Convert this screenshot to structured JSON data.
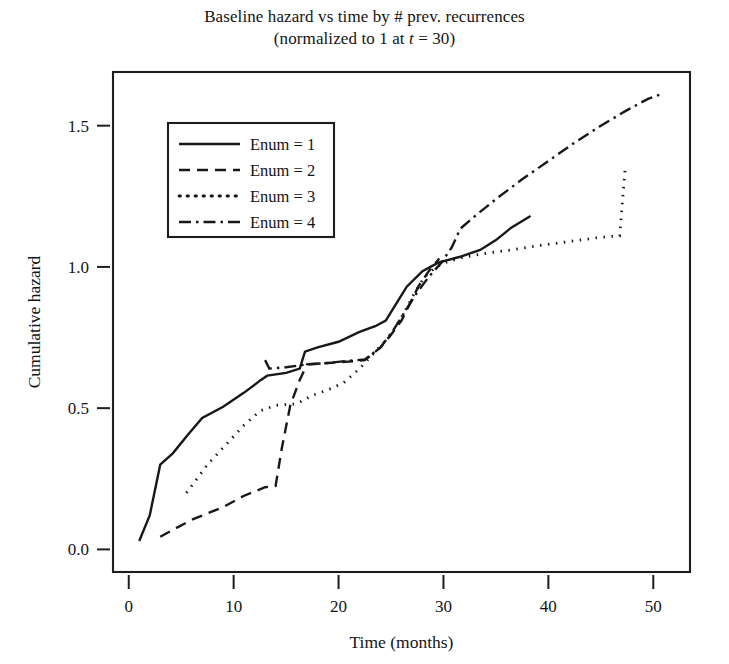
{
  "chart_data": {
    "type": "line",
    "title": "Baseline hazard vs time by # prev. recurrences",
    "subtitle": "(normalized to 1 at t = 30)",
    "title_line1": "Baseline hazard vs time by # prev. recurrences",
    "subtitle_prefix": "(normalized to 1 at ",
    "subtitle_italic": "t",
    "subtitle_suffix": " = 30)",
    "xlabel": "Time (months)",
    "ylabel": "Cumulative hazard",
    "xlim": [
      -1.5,
      53.5
    ],
    "ylim": [
      -0.08,
      1.69
    ],
    "xticks": [
      0,
      10,
      20,
      30,
      40,
      50
    ],
    "xtick_labels": [
      "0",
      "10",
      "20",
      "30",
      "40",
      "50"
    ],
    "yticks": [
      0.0,
      0.5,
      1.0,
      1.5
    ],
    "ytick_labels": [
      "0.0",
      "0.5",
      "1.0",
      "1.5"
    ],
    "grid": false,
    "legend_position": "upper-left-inside",
    "line_color": "#18181a",
    "series": [
      {
        "name": "Enum = 1",
        "dash": "solid",
        "dasharray": "none",
        "width": 2.4,
        "points": [
          [
            1.0,
            0.03
          ],
          [
            2.0,
            0.12
          ],
          [
            3.0,
            0.3
          ],
          [
            4.2,
            0.34
          ],
          [
            5.5,
            0.4
          ],
          [
            7.0,
            0.465
          ],
          [
            9.0,
            0.505
          ],
          [
            11.0,
            0.555
          ],
          [
            12.6,
            0.6
          ],
          [
            13.2,
            0.615
          ],
          [
            15.0,
            0.625
          ],
          [
            16.3,
            0.64
          ],
          [
            16.8,
            0.7
          ],
          [
            18.0,
            0.715
          ],
          [
            20.0,
            0.735
          ],
          [
            22.0,
            0.77
          ],
          [
            23.5,
            0.79
          ],
          [
            24.5,
            0.81
          ],
          [
            25.5,
            0.87
          ],
          [
            26.5,
            0.93
          ],
          [
            28.0,
            0.985
          ],
          [
            29.5,
            1.015
          ],
          [
            31.5,
            1.035
          ],
          [
            33.5,
            1.06
          ],
          [
            35.0,
            1.095
          ],
          [
            36.5,
            1.14
          ],
          [
            38.3,
            1.18
          ]
        ]
      },
      {
        "name": "Enum = 2",
        "dash": "dashed",
        "dasharray": "11,7",
        "width": 2.4,
        "points": [
          [
            3.0,
            0.045
          ],
          [
            6.0,
            0.105
          ],
          [
            9.0,
            0.15
          ],
          [
            11.0,
            0.19
          ],
          [
            13.0,
            0.22
          ],
          [
            14.0,
            0.225
          ],
          [
            14.6,
            0.36
          ],
          [
            15.4,
            0.51
          ],
          [
            16.3,
            0.6
          ],
          [
            17.0,
            0.655
          ],
          [
            19.0,
            0.66
          ],
          [
            21.0,
            0.665
          ],
          [
            22.5,
            0.67
          ],
          [
            24.0,
            0.715
          ],
          [
            25.0,
            0.76
          ],
          [
            26.0,
            0.81
          ],
          [
            26.8,
            0.87
          ],
          [
            27.6,
            0.93
          ],
          [
            28.6,
            0.985
          ],
          [
            29.6,
            1.03
          ]
        ]
      },
      {
        "name": "Enum = 3",
        "dash": "dotted",
        "dasharray": "1.5,6.5",
        "width": 2.8,
        "points": [
          [
            5.5,
            0.2
          ],
          [
            7.5,
            0.3
          ],
          [
            9.5,
            0.38
          ],
          [
            11.0,
            0.44
          ],
          [
            12.5,
            0.49
          ],
          [
            14.0,
            0.51
          ],
          [
            16.0,
            0.515
          ],
          [
            17.5,
            0.545
          ],
          [
            19.0,
            0.565
          ],
          [
            20.5,
            0.59
          ],
          [
            22.0,
            0.64
          ],
          [
            23.5,
            0.7
          ],
          [
            25.0,
            0.76
          ],
          [
            26.2,
            0.835
          ],
          [
            27.2,
            0.905
          ],
          [
            28.2,
            0.965
          ],
          [
            29.3,
            1.0
          ],
          [
            30.5,
            1.02
          ],
          [
            32.0,
            1.035
          ],
          [
            34.0,
            1.048
          ],
          [
            36.5,
            1.06
          ],
          [
            39.0,
            1.075
          ],
          [
            42.0,
            1.09
          ],
          [
            45.0,
            1.105
          ],
          [
            46.8,
            1.11
          ],
          [
            47.1,
            1.25
          ],
          [
            47.3,
            1.34
          ]
        ]
      },
      {
        "name": "Enum = 4",
        "dash": "dashdot",
        "dasharray": "12,5,2.5,5",
        "width": 2.4,
        "points": [
          [
            13.0,
            0.67
          ],
          [
            13.4,
            0.64
          ],
          [
            15.0,
            0.645
          ],
          [
            17.0,
            0.655
          ],
          [
            19.0,
            0.66
          ],
          [
            21.0,
            0.668
          ],
          [
            22.5,
            0.672
          ],
          [
            24.0,
            0.715
          ],
          [
            25.2,
            0.775
          ],
          [
            26.3,
            0.84
          ],
          [
            27.4,
            0.905
          ],
          [
            28.6,
            0.965
          ],
          [
            29.8,
            1.015
          ],
          [
            30.8,
            1.07
          ],
          [
            31.6,
            1.135
          ],
          [
            33.0,
            1.18
          ],
          [
            35.0,
            1.24
          ],
          [
            37.5,
            1.31
          ],
          [
            40.0,
            1.375
          ],
          [
            42.5,
            1.44
          ],
          [
            45.0,
            1.5
          ],
          [
            47.5,
            1.555
          ],
          [
            49.5,
            1.595
          ],
          [
            51.0,
            1.615
          ]
        ]
      }
    ],
    "legend_entries": [
      {
        "label": "Enum = 1",
        "dash": "solid"
      },
      {
        "label": "Enum = 2",
        "dash": "dashed"
      },
      {
        "label": "Enum = 3",
        "dash": "dotted"
      },
      {
        "label": "Enum = 4",
        "dash": "dashdot"
      }
    ]
  }
}
